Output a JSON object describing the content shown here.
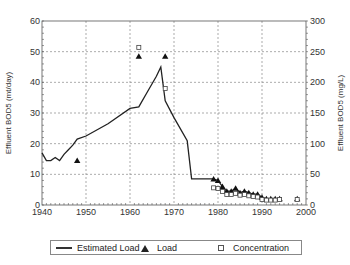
{
  "chart_data": {
    "type": "line",
    "title": "",
    "xlabel": "",
    "ylabel": "Effluent BOD5 (mt/day)",
    "ylabel_right": "Effluent BOD5 (mg/L)",
    "xlim": [
      1940,
      2000
    ],
    "ylim": [
      0,
      60
    ],
    "ylim_right": [
      0,
      300
    ],
    "x_ticks": [
      "1940",
      "1950",
      "1960",
      "1970",
      "1980",
      "1990",
      "2000"
    ],
    "y_ticks": [
      "0",
      "10",
      "20",
      "30",
      "40",
      "50",
      "60"
    ],
    "y_ticks_right": [
      "0",
      "50",
      "100",
      "150",
      "200",
      "250",
      "300"
    ],
    "grid": true,
    "legend_position": "bottom",
    "series": [
      {
        "name": "Estimated Load",
        "style": "line",
        "axis": "left",
        "x": [
          1940,
          1941,
          1942,
          1943,
          1944,
          1945,
          1946,
          1947,
          1948,
          1950,
          1955,
          1960,
          1962,
          1964,
          1966,
          1967,
          1968,
          1970,
          1973,
          1974,
          1979,
          1980,
          1981,
          1982,
          1983,
          1984,
          1985,
          1986,
          1987,
          1988,
          1989,
          1990,
          1991,
          1992,
          1993,
          1994
        ],
        "values": [
          17,
          14.5,
          14.5,
          15.5,
          14.5,
          16.5,
          18,
          19.5,
          21.5,
          22.5,
          26.5,
          31.5,
          32,
          37,
          42,
          45,
          34,
          28.5,
          21,
          8.5,
          8.5,
          8,
          6,
          4.5,
          4.5,
          5.5,
          4,
          4.5,
          4,
          3.5,
          3.5,
          2.5,
          2,
          2,
          2,
          2
        ]
      },
      {
        "name": "Load",
        "style": "triangle",
        "axis": "left",
        "x": [
          1948,
          1962,
          1968,
          1979,
          1980,
          1981,
          1982,
          1983,
          1984,
          1985,
          1986,
          1987,
          1988,
          1989,
          1990,
          1991,
          1992,
          1993,
          1994,
          1998
        ],
        "values": [
          14.5,
          48.5,
          48.5,
          8.5,
          8,
          6,
          4.5,
          4.5,
          5.5,
          4,
          4.5,
          4,
          3.5,
          3.5,
          2.5,
          2,
          2,
          2,
          2,
          2
        ]
      },
      {
        "name": "Concentration",
        "style": "square",
        "axis": "right",
        "x": [
          1962,
          1968,
          1979,
          1980,
          1981,
          1982,
          1983,
          1984,
          1985,
          1986,
          1987,
          1988,
          1989,
          1990,
          1991,
          1992,
          1993,
          1994,
          1998
        ],
        "values": [
          257,
          190,
          28,
          27,
          22,
          17,
          17,
          19,
          16,
          17,
          15,
          14,
          13,
          9,
          8,
          8,
          8,
          9,
          9
        ]
      }
    ]
  },
  "legend": {
    "estimated_load": "Estimated Load",
    "load": "Load",
    "concentration": "Concentration"
  }
}
